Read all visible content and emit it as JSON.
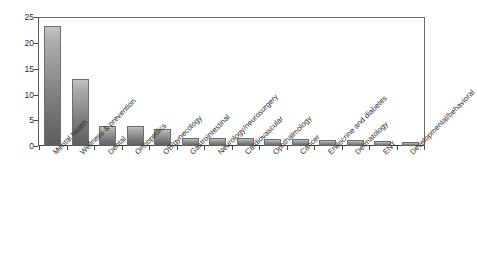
{
  "chart_data": {
    "type": "bar",
    "title": "",
    "subtitle": "",
    "xlabel": "",
    "ylabel": "",
    "ylim": [
      0,
      25
    ],
    "ytick_labels": [
      "25",
      "20",
      "15",
      "10",
      "5",
      "0"
    ],
    "ytick_values": [
      25,
      20,
      15,
      10,
      5,
      0
    ],
    "grid": false,
    "legend": false,
    "legend_position": "none",
    "orientation": "vertical",
    "bar_color_top": "#c2c2c2",
    "bar_color_bottom": "#5e5e5e",
    "bar_edge_color": "#6d6d6d",
    "axis_color": "#4a4a4a",
    "background_color": "#ffffff",
    "categories": [
      "Mental health",
      "Wellness & prevention",
      "Dental",
      "Orthopedics",
      "OB/gynecology",
      "Gastrointestinal",
      "Neurology/neurosurgery",
      "Cardiovascular",
      "Ophthalmology",
      "Cancer",
      "Endocrine and diabetes",
      "Dermatology",
      "ENT",
      "Developmental/behavioral"
    ],
    "values": [
      23.5,
      13.1,
      4.0,
      4.0,
      3.3,
      1.6,
      1.5,
      1.5,
      1.4,
      1.4,
      1.2,
      1.1,
      1.0,
      0.8
    ]
  }
}
